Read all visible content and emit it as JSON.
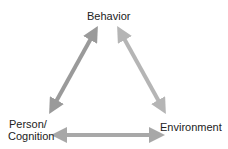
{
  "diagram": {
    "nodes": {
      "top": "Behavior",
      "bottom_left_line1": "Person/",
      "bottom_left_line2": "Cognition",
      "bottom_right": "Environment"
    },
    "arrows": [
      {
        "from": "Person/Cognition",
        "to": "Behavior",
        "type": "bidirectional"
      },
      {
        "from": "Behavior",
        "to": "Environment",
        "type": "bidirectional"
      },
      {
        "from": "Person/Cognition",
        "to": "Environment",
        "type": "bidirectional"
      }
    ],
    "colors": {
      "left_arrow": "#9a9a9a",
      "right_arrow": "#b5b5b5",
      "bottom_arrow": "#a8a8a8"
    }
  }
}
